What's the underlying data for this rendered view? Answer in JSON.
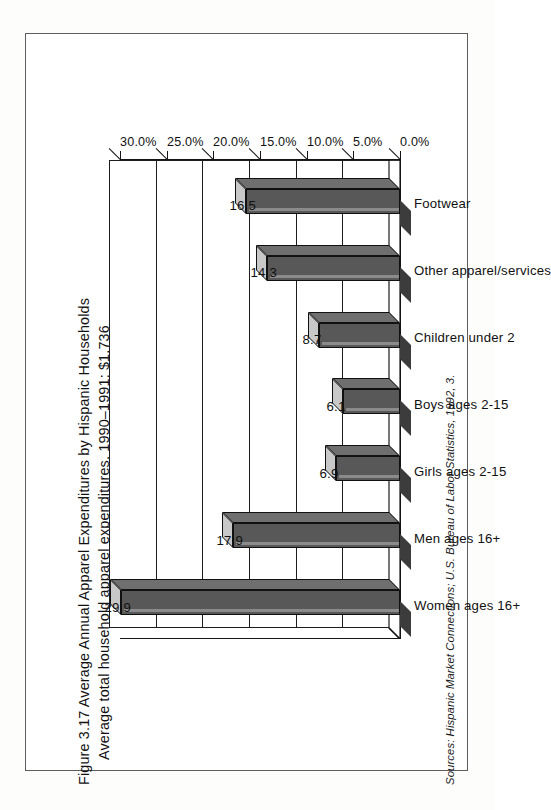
{
  "figure": {
    "title_line_1": "Figure 3.17  Average Annual Apparel Expenditures by Hispanic Households",
    "title_line_2": "Average total household apparel expenditures, 1990–1991: $1,736",
    "source": "Sources: Hispanic Market Connections; U.S. Bureau of Labor Statistics, 1992, 3."
  },
  "chart_data": {
    "type": "bar",
    "title": "Figure 3.17  Average Annual Apparel Expenditures by Hispanic Households",
    "subtitle": "Average total household apparel expenditures, 1990–1991: $1,736",
    "xlabel": "",
    "ylabel": "",
    "ylim": [
      0,
      30
    ],
    "grid": true,
    "legend": "none",
    "orientation": "vertical",
    "value_suffix": "",
    "categories": [
      "Women ages 16+",
      "Men ages 16+",
      "Girls ages 2-15",
      "Boys ages 2-15",
      "Children under 2",
      "Other apparel/services",
      "Footwear"
    ],
    "values": [
      29.9,
      17.9,
      6.9,
      6.1,
      8.7,
      14.3,
      16.5
    ],
    "data_labels": [
      "29.9",
      "17.9",
      "6.9",
      "6.1",
      "8.7",
      "14.3",
      "16.5"
    ],
    "yticks": [
      0,
      5,
      10,
      15,
      20,
      25,
      30
    ],
    "ytick_labels": [
      "0.0%",
      "5.0%",
      "10.0%",
      "15.0%",
      "20.0%",
      "25.0%",
      "30.0%"
    ],
    "bar_color": "#585858",
    "bar_top_color": "#c8c8c8",
    "bar_side_color": "#6f6f6f",
    "axis_color": "#141414"
  }
}
